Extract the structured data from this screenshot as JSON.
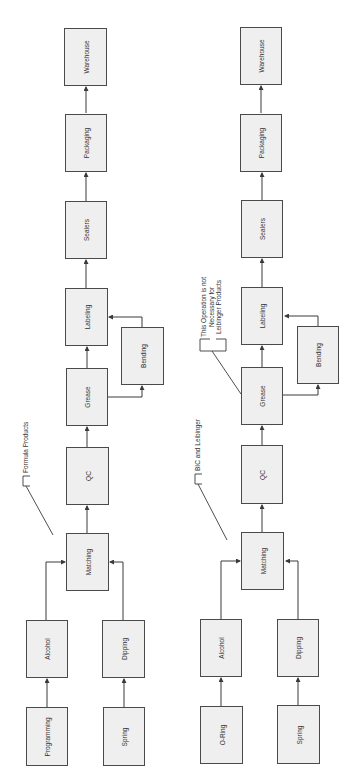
{
  "diagrams": [
    {
      "name": "formula-products-flow",
      "annotation": "Formula Products",
      "boxes": {
        "warehouse": "Warehouse",
        "packaging": "Packaging",
        "sealers": "Sealers",
        "labeling": "Labeling",
        "bending": "Bending",
        "grease": "Grease",
        "qc": "QC",
        "matching": "Matching",
        "alcohol": "Alcohol",
        "programming": "Programming",
        "dipping": "Dipping",
        "spring": "Spring"
      }
    },
    {
      "name": "bic-leibinger-flow",
      "annotation": "BIC and Leibinger",
      "grease_note": [
        "This Operation is not",
        "Necessary for",
        "Leibinger Products"
      ],
      "boxes": {
        "warehouse": "Warehouse",
        "packaging": "Packaging",
        "sealers": "Sealers",
        "labeling": "Labeling",
        "bending": "Bending",
        "grease": "Grease",
        "qc": "QC",
        "matching": "Matching",
        "alcohol": "Alcohol",
        "oring": "O-Ring",
        "dipping": "Dipping",
        "spring": "Spring"
      }
    }
  ],
  "colors": {
    "line": "#3a3a3a",
    "box_fill": "#efefef",
    "box_border": "#4a4a4a"
  }
}
